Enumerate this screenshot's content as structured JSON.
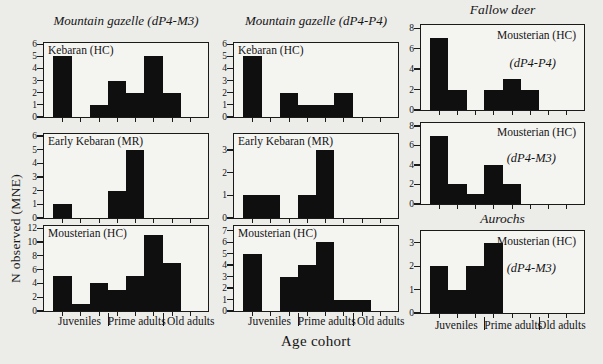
{
  "figure": {
    "xlabel": "Age cohort",
    "ylabel": "N observed (MNE)",
    "cohort_labels": [
      "Juveniles",
      "Prime adults",
      "Old adults"
    ],
    "bar_color": "#0f0f0f",
    "background_color": "#ecece9",
    "panel_background": "#f4f4f1"
  },
  "titles": {
    "col1": "Mountain gazelle (dP4-M3)",
    "col2": "Mountain gazelle (dP4-P4)",
    "col3_top": "Fallow deer",
    "col3_bottom": "Aurochs"
  },
  "chart_data": {
    "type": "bar",
    "grid": "3 columns x 3 rows of mortality-profile histograms",
    "bins_per_panel": 8,
    "x_cohorts": [
      {
        "label": "Juveniles",
        "bins": [
          1,
          3
        ]
      },
      {
        "label": "Prime adults",
        "bins": [
          4,
          6
        ]
      },
      {
        "label": "Old adults",
        "bins": [
          7,
          8
        ]
      }
    ],
    "xlabel": "Age cohort",
    "ylabel": "N observed (MNE)",
    "panels": [
      {
        "label": "Kebaran (HC)",
        "sublabel": "",
        "values": [
          5,
          0,
          1,
          3,
          2,
          5,
          2,
          0
        ],
        "yticks": [
          0,
          1,
          2,
          3,
          4,
          5,
          6
        ],
        "ylim": [
          0,
          6.1
        ]
      },
      {
        "label": "Early Kebaran (MR)",
        "sublabel": "",
        "values": [
          1,
          0,
          0,
          2,
          5,
          0,
          0,
          0
        ],
        "yticks": [
          0,
          1,
          2,
          3,
          4,
          5,
          6
        ],
        "ylim": [
          0,
          6.15
        ]
      },
      {
        "label": "Mousterian (HC)",
        "sublabel": "",
        "values": [
          5,
          1,
          4,
          3,
          5,
          11,
          7,
          0
        ],
        "yticks": [
          0,
          2,
          4,
          6,
          8,
          10,
          12
        ],
        "ylim": [
          0,
          12.3
        ]
      },
      {
        "label": "Kebaran (HC)",
        "sublabel": "",
        "values": [
          5,
          0,
          2,
          1,
          1,
          2,
          0,
          0
        ],
        "yticks": [
          0,
          1,
          2,
          3,
          4,
          5,
          6
        ],
        "ylim": [
          0,
          6.1
        ]
      },
      {
        "label": "Early Kebaran (MR)",
        "sublabel": "",
        "values": [
          1,
          1,
          0,
          1,
          3,
          0,
          0,
          0
        ],
        "yticks": [
          0,
          1,
          2,
          3
        ],
        "ylim": [
          0,
          3.7
        ]
      },
      {
        "label": "Mousterian (HC)",
        "sublabel": "",
        "values": [
          5,
          0,
          3,
          4,
          6,
          1,
          1,
          0
        ],
        "yticks": [
          0,
          1,
          2,
          3,
          4,
          5,
          6,
          7
        ],
        "ylim": [
          0,
          7.4
        ]
      },
      {
        "label": "Mousterian (HC)",
        "sublabel": "(dP4-P4)",
        "values": [
          7,
          2,
          0,
          2,
          3,
          2,
          0,
          0
        ],
        "yticks": [
          0,
          2,
          4,
          6,
          8
        ],
        "ylim": [
          0,
          8.3
        ]
      },
      {
        "label": "Mousterian (HC)",
        "sublabel": "(dP4-M3)",
        "values": [
          7,
          2,
          1,
          4,
          2,
          0,
          0,
          0
        ],
        "yticks": [
          0,
          2,
          4,
          6,
          8
        ],
        "ylim": [
          0,
          8.3
        ]
      },
      {
        "label": "Mousterian (HC)",
        "sublabel": "(dP4-M3)",
        "values": [
          2,
          1,
          2,
          3,
          0,
          0,
          0,
          0
        ],
        "yticks": [
          0,
          1,
          2,
          3
        ],
        "ylim": [
          0,
          3.5
        ]
      }
    ]
  }
}
